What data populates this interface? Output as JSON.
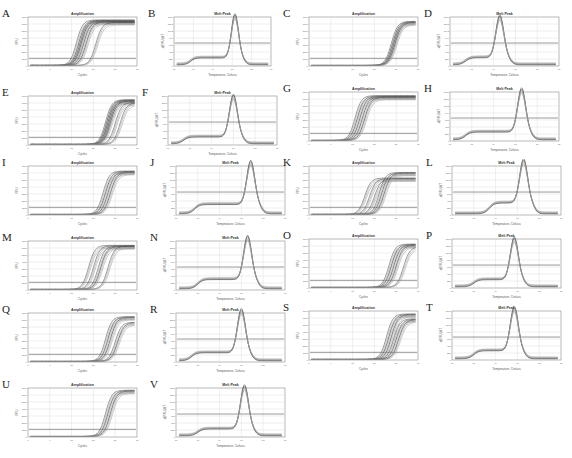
{
  "figure": {
    "panel_count": 22,
    "colors": {
      "curve": "#3a3a3a",
      "curve_light": "#9a9a9a",
      "threshold": "#555555",
      "grid": "#d6d6d6",
      "frame": "#8a8a8a"
    }
  },
  "chart_data": [
    {
      "id": "A",
      "type": "line",
      "title": "Amplification",
      "xlabel": "Cycles",
      "ylabel": "RFU",
      "xlim": [
        0,
        45
      ],
      "ylim": [
        0,
        7000
      ],
      "threshold": 1100,
      "series": [
        {
          "name": "group-1",
          "ct": [
            17,
            18,
            18.5,
            19,
            20
          ],
          "plateau": 6500
        },
        {
          "name": "group-2",
          "ct": [
            21,
            25
          ],
          "plateau": 6200
        }
      ]
    },
    {
      "id": "B",
      "type": "line",
      "title": "Melt Peak",
      "xlabel": "Temperature, Celsius",
      "ylabel": "-d(RFU)/dT",
      "xlim": [
        60,
        95
      ],
      "ylim": [
        0,
        1600
      ],
      "threshold": 750,
      "series": [
        {
          "name": "melt",
          "shoulder_temp": 66,
          "shoulder_value": 220,
          "peak_temp": 82,
          "peak_value": 1450
        }
      ]
    },
    {
      "id": "C",
      "type": "line",
      "title": "Amplification",
      "xlabel": "Cycles",
      "ylabel": "RFU",
      "xlim": [
        0,
        45
      ],
      "ylim": [
        0,
        7000
      ],
      "threshold": 1100,
      "series": [
        {
          "name": "group-1",
          "ct": [
            31,
            31.5,
            32,
            32.5
          ],
          "plateau": 6300
        }
      ]
    },
    {
      "id": "D",
      "type": "line",
      "title": "Melt Peak",
      "xlabel": "Temperature, Celsius",
      "ylabel": "-d(RFU)/dT",
      "xlim": [
        60,
        95
      ],
      "ylim": [
        0,
        1600
      ],
      "threshold": 750,
      "series": [
        {
          "name": "melt",
          "shoulder_temp": 65,
          "shoulder_value": 230,
          "peak_temp": 76,
          "peak_value": 1400
        }
      ]
    },
    {
      "id": "E",
      "type": "line",
      "title": "Amplification",
      "xlabel": "Cycles",
      "ylabel": "RFU",
      "xlim": [
        0,
        45
      ],
      "ylim": [
        0,
        7000
      ],
      "threshold": 1100,
      "series": [
        {
          "name": "group-1",
          "ct": [
            29,
            29.5,
            30,
            30.5,
            31
          ],
          "plateau": 6400
        },
        {
          "name": "group-2",
          "ct": [
            33,
            35
          ],
          "plateau": 6000
        }
      ]
    },
    {
      "id": "F",
      "type": "line",
      "title": "Melt Peak",
      "xlabel": "Temperature, Celsius",
      "ylabel": "-d(RFU)/dT",
      "xlim": [
        60,
        95
      ],
      "ylim": [
        0,
        1600
      ],
      "threshold": 750,
      "series": [
        {
          "name": "melt",
          "shoulder_temp": 65,
          "shoulder_value": 220,
          "peak_temp": 81,
          "peak_value": 1400
        }
      ]
    },
    {
      "id": "G",
      "type": "line",
      "title": "Amplification",
      "xlabel": "Cycles",
      "ylabel": "RFU",
      "xlim": [
        0,
        45
      ],
      "ylim": [
        0,
        7000
      ],
      "threshold": 1100,
      "series": [
        {
          "name": "group-1",
          "ct": [
            16,
            17,
            18,
            19,
            20
          ],
          "plateau": 6400
        }
      ]
    },
    {
      "id": "H",
      "type": "line",
      "title": "Melt Peak",
      "xlabel": "Temperature, Celsius",
      "ylabel": "-d(RFU)/dT",
      "xlim": [
        60,
        95
      ],
      "ylim": [
        0,
        1600
      ],
      "threshold": 750,
      "series": [
        {
          "name": "melt",
          "shoulder_temp": 65,
          "shoulder_value": 250,
          "peak_temp": 83,
          "peak_value": 1450
        }
      ]
    },
    {
      "id": "I",
      "type": "line",
      "title": "Amplification",
      "xlabel": "Cycles",
      "ylabel": "RFU",
      "xlim": [
        0,
        45
      ],
      "ylim": [
        0,
        7000
      ],
      "threshold": 1100,
      "series": [
        {
          "name": "group-1",
          "ct": [
            28,
            29,
            30,
            31
          ],
          "plateau": 6200
        }
      ]
    },
    {
      "id": "J",
      "type": "line",
      "title": "Melt Peak",
      "xlabel": "Temperature, Celsius",
      "ylabel": "-d(RFU)/dT",
      "xlim": [
        60,
        95
      ],
      "ylim": [
        0,
        1600
      ],
      "threshold": 750,
      "series": [
        {
          "name": "melt",
          "shoulder_temp": 66,
          "shoulder_value": 300,
          "peak_temp": 84,
          "peak_value": 1450
        }
      ]
    },
    {
      "id": "K",
      "type": "line",
      "title": "Amplification",
      "xlabel": "Cycles",
      "ylabel": "RFU",
      "xlim": [
        0,
        45
      ],
      "ylim": [
        0,
        7000
      ],
      "threshold": 1100,
      "series": [
        {
          "name": "group-1",
          "ct": [
            20,
            22,
            24
          ],
          "plateau": 5200
        },
        {
          "name": "group-2",
          "ct": [
            26,
            27,
            28
          ],
          "plateau": 6000
        }
      ]
    },
    {
      "id": "L",
      "type": "line",
      "title": "Melt Peak",
      "xlabel": "Temperature, Celsius",
      "ylabel": "-d(RFU)/dT",
      "xlim": [
        60,
        95
      ],
      "ylim": [
        0,
        1600
      ],
      "threshold": 750,
      "series": [
        {
          "name": "melt",
          "shoulder_temp": 72,
          "shoulder_value": 350,
          "peak_temp": 83,
          "peak_value": 1450
        }
      ]
    },
    {
      "id": "M",
      "type": "line",
      "title": "Amplification",
      "xlabel": "Cycles",
      "ylabel": "RFU",
      "xlim": [
        0,
        45
      ],
      "ylim": [
        0,
        7000
      ],
      "threshold": 1100,
      "series": [
        {
          "name": "group-1",
          "ct": [
            22,
            24,
            26,
            27
          ],
          "plateau": 6300
        },
        {
          "name": "group-2",
          "ct": [
            30
          ],
          "plateau": 6200
        }
      ]
    },
    {
      "id": "N",
      "type": "line",
      "title": "Melt Peak",
      "xlabel": "Temperature, Celsius",
      "ylabel": "-d(RFU)/dT",
      "xlim": [
        60,
        95
      ],
      "ylim": [
        0,
        1600
      ],
      "threshold": 750,
      "series": [
        {
          "name": "melt",
          "shoulder_temp": 67,
          "shoulder_value": 300,
          "peak_temp": 83,
          "peak_value": 1450
        }
      ]
    },
    {
      "id": "O",
      "type": "line",
      "title": "Amplification",
      "xlabel": "Cycles",
      "ylabel": "RFU",
      "xlim": [
        0,
        45
      ],
      "ylim": [
        0,
        7000
      ],
      "threshold": 1100,
      "series": [
        {
          "name": "group-1",
          "ct": [
            30,
            31,
            32,
            33
          ],
          "plateau": 6200
        },
        {
          "name": "group-2",
          "ct": [
            36
          ],
          "plateau": 5800
        }
      ]
    },
    {
      "id": "P",
      "type": "line",
      "title": "Melt Peak",
      "xlabel": "Temperature, Celsius",
      "ylabel": "-d(RFU)/dT",
      "xlim": [
        60,
        95
      ],
      "ylim": [
        0,
        1600
      ],
      "threshold": 750,
      "series": [
        {
          "name": "melt",
          "shoulder_temp": 67,
          "shoulder_value": 230,
          "peak_temp": 80,
          "peak_value": 1400
        }
      ]
    },
    {
      "id": "Q",
      "type": "line",
      "title": "Amplification",
      "xlabel": "Cycles",
      "ylabel": "RFU",
      "xlim": [
        0,
        45
      ],
      "ylim": [
        0,
        7000
      ],
      "threshold": 1100,
      "series": [
        {
          "name": "group-1",
          "ct": [
            29,
            30,
            31
          ],
          "plateau": 6400
        },
        {
          "name": "group-2",
          "ct": [
            33,
            34
          ],
          "plateau": 5600
        }
      ]
    },
    {
      "id": "R",
      "type": "line",
      "title": "Melt Peak",
      "xlabel": "Temperature, Celsius",
      "ylabel": "-d(RFU)/dT",
      "xlim": [
        60,
        95
      ],
      "ylim": [
        0,
        1600
      ],
      "threshold": 750,
      "series": [
        {
          "name": "melt",
          "shoulder_temp": 65,
          "shoulder_value": 260,
          "peak_temp": 81,
          "peak_value": 1450
        }
      ]
    },
    {
      "id": "S",
      "type": "line",
      "title": "Amplification",
      "xlabel": "Cycles",
      "ylabel": "RFU",
      "xlim": [
        0,
        45
      ],
      "ylim": [
        0,
        7000
      ],
      "threshold": 1100,
      "series": [
        {
          "name": "group-1",
          "ct": [
            29,
            30,
            31
          ],
          "plateau": 6500
        },
        {
          "name": "group-2",
          "ct": [
            32,
            33,
            34
          ],
          "plateau": 5800
        }
      ]
    },
    {
      "id": "T",
      "type": "line",
      "title": "Melt Peak",
      "xlabel": "Temperature, Celsius",
      "ylabel": "-d(RFU)/dT",
      "xlim": [
        60,
        95
      ],
      "ylim": [
        0,
        1600
      ],
      "threshold": 750,
      "series": [
        {
          "name": "melt",
          "shoulder_temp": 67,
          "shoulder_value": 260,
          "peak_temp": 80,
          "peak_value": 1450
        }
      ]
    },
    {
      "id": "U",
      "type": "line",
      "title": "Amplification",
      "xlabel": "Cycles",
      "ylabel": "RFU",
      "xlim": [
        0,
        45
      ],
      "ylim": [
        0,
        7000
      ],
      "threshold": 1100,
      "series": [
        {
          "name": "group-1",
          "ct": [
            29,
            30,
            31
          ],
          "plateau": 6600
        }
      ]
    },
    {
      "id": "V",
      "type": "line",
      "title": "Melt Peak",
      "xlabel": "Temperature, Celsius",
      "ylabel": "-d(RFU)/dT",
      "xlim": [
        60,
        95
      ],
      "ylim": [
        0,
        1600
      ],
      "threshold": 750,
      "series": [
        {
          "name": "melt",
          "shoulder_temp": 67,
          "shoulder_value": 220,
          "peak_temp": 82,
          "peak_value": 1450
        }
      ]
    }
  ],
  "layout": [
    {
      "id": "A",
      "x": 2,
      "y": 8,
      "w": 140,
      "h": 72
    },
    {
      "id": "B",
      "x": 148,
      "y": 8,
      "w": 128,
      "h": 72
    },
    {
      "id": "C",
      "x": 283,
      "y": 8,
      "w": 140,
      "h": 72
    },
    {
      "id": "D",
      "x": 424,
      "y": 8,
      "w": 140,
      "h": 72
    },
    {
      "id": "E",
      "x": 2,
      "y": 87,
      "w": 140,
      "h": 72
    },
    {
      "id": "F",
      "x": 142,
      "y": 87,
      "w": 140,
      "h": 72
    },
    {
      "id": "G",
      "x": 283,
      "y": 83,
      "w": 140,
      "h": 72
    },
    {
      "id": "H",
      "x": 424,
      "y": 83,
      "w": 140,
      "h": 72
    },
    {
      "id": "I",
      "x": 2,
      "y": 157,
      "w": 140,
      "h": 72
    },
    {
      "id": "J",
      "x": 150,
      "y": 157,
      "w": 140,
      "h": 72
    },
    {
      "id": "K",
      "x": 283,
      "y": 157,
      "w": 140,
      "h": 72
    },
    {
      "id": "L",
      "x": 426,
      "y": 157,
      "w": 140,
      "h": 72
    },
    {
      "id": "M",
      "x": 2,
      "y": 232,
      "w": 140,
      "h": 72
    },
    {
      "id": "N",
      "x": 150,
      "y": 232,
      "w": 140,
      "h": 72
    },
    {
      "id": "O",
      "x": 283,
      "y": 230,
      "w": 140,
      "h": 72
    },
    {
      "id": "P",
      "x": 426,
      "y": 230,
      "w": 140,
      "h": 72
    },
    {
      "id": "Q",
      "x": 2,
      "y": 304,
      "w": 140,
      "h": 72
    },
    {
      "id": "R",
      "x": 150,
      "y": 304,
      "w": 140,
      "h": 72
    },
    {
      "id": "S",
      "x": 283,
      "y": 302,
      "w": 140,
      "h": 72
    },
    {
      "id": "T",
      "x": 426,
      "y": 302,
      "w": 140,
      "h": 72
    },
    {
      "id": "U",
      "x": 2,
      "y": 379,
      "w": 140,
      "h": 72
    },
    {
      "id": "V",
      "x": 150,
      "y": 379,
      "w": 140,
      "h": 72
    }
  ]
}
